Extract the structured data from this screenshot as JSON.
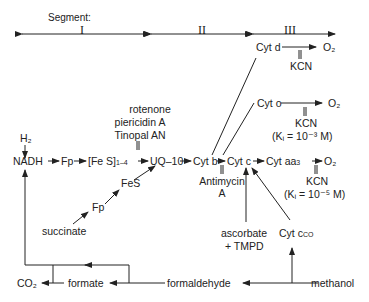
{
  "segments": {
    "label": "Segment:",
    "names": [
      "I",
      "II",
      "III"
    ]
  },
  "nodes": {
    "h2": "H₂",
    "nadh": "NADH",
    "fp1": "Fp",
    "fes_cluster": "[Fe S]",
    "fes_cluster_sub": "1–4",
    "uq10": "UQ–10",
    "cyt_b": "Cyt b",
    "cyt_c": "Cyt c",
    "cyt_aa3": "Cyt aa",
    "cyt_aa3_sub": "3",
    "o2_aa3": "O₂",
    "cyt_d": "Cyt d",
    "o2_d": "O₂",
    "cyt_o": "Cyt o",
    "o2_o": "O₂",
    "fes": "FeS",
    "fp2": "Fp",
    "succinate": "succinate",
    "ascorbate": "ascorbate",
    "tmpd": "+ TMPD",
    "cyt_cco": "Cyt c",
    "cyt_cco_sub": "CO",
    "co2": "CO₂",
    "formate": "formate",
    "formaldehyde": "formaldehyde",
    "methanol": "methanol"
  },
  "inhibitors": {
    "complex1": [
      "rotenone",
      "piericidin A",
      "Tinopal AN"
    ],
    "antimycin": [
      "Antimycin",
      "A"
    ],
    "kcn_d": "KCN",
    "kcn_o": "KCN",
    "kcn_o_ki": "(Kᵢ = 10⁻³ M)",
    "kcn_aa3": "KCN",
    "kcn_aa3_ki": "(Kᵢ = 10⁻⁵ M)"
  }
}
